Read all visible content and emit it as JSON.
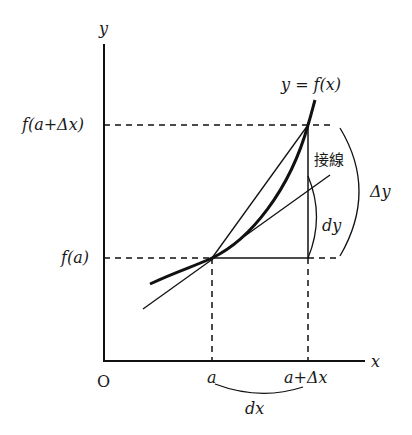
{
  "diagram": {
    "axes": {
      "x_label": "x",
      "y_label": "y",
      "origin_label": "O"
    },
    "curve_label": "y = f(x)",
    "tangent_label": "接線",
    "y_ticks": {
      "upper": "f(a+Δx)",
      "lower": "f(a)"
    },
    "x_ticks": {
      "left": "a",
      "right": "a+Δx"
    },
    "brace_labels": {
      "dx": "dx",
      "dy": "dy",
      "delta_y": "Δy"
    }
  }
}
